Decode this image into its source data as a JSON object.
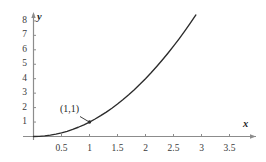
{
  "chart_data": {
    "type": "line",
    "title": "",
    "subtitle": "",
    "xlabel": "x",
    "ylabel": "y",
    "xlim": [
      0,
      3.6
    ],
    "ylim": [
      0,
      8.8
    ],
    "grid": false,
    "legend": "none",
    "function": "y = x^2",
    "x_ticks": [
      0.5,
      1,
      1.5,
      2,
      2.5,
      3,
      3.5
    ],
    "x_tick_labels": [
      "0.5",
      "1",
      "1.5",
      "2",
      "2.5",
      "3",
      "3.5"
    ],
    "y_ticks": [
      1,
      2,
      3,
      4,
      5,
      6,
      7,
      8
    ],
    "y_tick_labels": [
      "1",
      "2",
      "3",
      "4",
      "5",
      "6",
      "7",
      "8"
    ],
    "series": [
      {
        "name": "y = x^2",
        "color": "#2b2b2b",
        "x": [
          0,
          0.1,
          0.2,
          0.3,
          0.4,
          0.5,
          0.6,
          0.7,
          0.8,
          0.9,
          1.0,
          1.1,
          1.2,
          1.3,
          1.4,
          1.5,
          1.6,
          1.7,
          1.8,
          1.9,
          2.0,
          2.1,
          2.2,
          2.3,
          2.4,
          2.5,
          2.6,
          2.7,
          2.8,
          2.9
        ],
        "y": [
          0,
          0.01,
          0.04,
          0.09,
          0.16,
          0.25,
          0.36,
          0.49,
          0.64,
          0.81,
          1.0,
          1.21,
          1.44,
          1.69,
          1.96,
          2.25,
          2.56,
          2.89,
          3.24,
          3.61,
          4.0,
          4.41,
          4.84,
          5.29,
          5.76,
          6.25,
          6.76,
          7.29,
          7.84,
          8.41
        ]
      }
    ],
    "annotations": [
      {
        "label": "(1,1)",
        "x": 1,
        "y": 1,
        "marker": "dot",
        "leader": true
      }
    ],
    "axis_color": "#8c8c8c",
    "curve_color": "#2b2b2b",
    "text_color": "#2b2b2b"
  },
  "axes": {
    "x_name": "x",
    "y_name": "y"
  },
  "annotation": {
    "point_label": "(1,1)"
  }
}
